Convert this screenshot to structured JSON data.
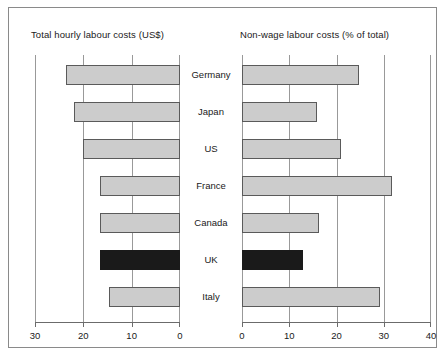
{
  "chart_data": {
    "type": "bar",
    "title": "",
    "orientation": "horizontal",
    "layout": "back-to-back paired horizontal bar panels",
    "categories": [
      "Germany",
      "Japan",
      "US",
      "France",
      "Canada",
      "UK",
      "Italy"
    ],
    "panels": [
      {
        "id": "left",
        "title": "Total hourly labour costs (US$)",
        "xlabel": "",
        "ylabel": "",
        "direction": "right-to-left",
        "xlim": [
          30,
          0
        ],
        "ticks": [
          30,
          20,
          10,
          0
        ],
        "tick_labels": [
          "30",
          "20",
          "10",
          "0"
        ],
        "grid": true,
        "values": [
          23.5,
          22.0,
          20.0,
          16.5,
          16.5,
          16.5,
          14.7
        ],
        "highlight_category": "UK"
      },
      {
        "id": "right",
        "title": "Non-wage labour costs (% of total)",
        "xlabel": "",
        "ylabel": "",
        "direction": "left-to-right",
        "xlim": [
          0,
          40
        ],
        "ticks": [
          0,
          10,
          20,
          30,
          40
        ],
        "tick_labels": [
          "0",
          "10",
          "20",
          "30",
          "40"
        ],
        "grid": true,
        "values": [
          24.7,
          15.8,
          21.0,
          31.8,
          16.3,
          12.9,
          29.3
        ],
        "highlight_category": "UK"
      }
    ],
    "colors": {
      "bar_fill": "#cccccc",
      "bar_border": "#5a5a5a",
      "highlight_fill": "#1a1a1a",
      "gridline": "#999999",
      "axis": "#6b6b6b",
      "frame": "#8a8a8a",
      "text": "#1a1a1a",
      "background": "#ffffff"
    }
  }
}
